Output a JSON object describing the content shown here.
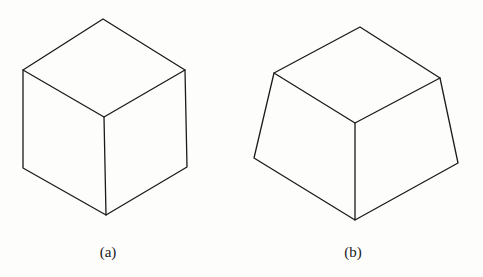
{
  "figures": [
    {
      "id": "a",
      "label": "(a)",
      "description": "Cube drawn in isometric view",
      "label_pos": [
        108,
        244
      ]
    },
    {
      "id": "b",
      "label": "(b)",
      "description": "Frustum-like shape: cube with flared (trapezoidal) side faces",
      "label_pos": [
        353,
        244
      ]
    }
  ],
  "colors": {
    "stroke": "#1a1a1a",
    "background": "#fdfdfb"
  }
}
